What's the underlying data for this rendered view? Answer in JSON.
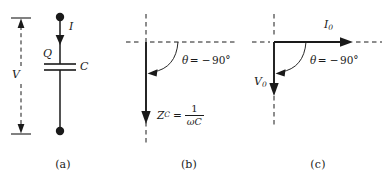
{
  "figure": {
    "background_color": "#ffffff",
    "ink_color": "#1a1a1a"
  },
  "panels": [
    {
      "id": "a",
      "caption": "(a)",
      "description": "Capacitor circuit branch with current, charge, capacitance and voltage labels",
      "labels": {
        "current": "I",
        "charge": "Q",
        "capacitance": "C",
        "voltage": "V"
      },
      "elements": {
        "top_node": "terminal-dot",
        "bottom_node": "terminal-dot",
        "component": "capacitor",
        "voltage_arrow": "double-headed-dashed-arrow"
      }
    },
    {
      "id": "b",
      "caption": "(b)",
      "description": "Impedance phasor diagram for a capacitor pointing along the negative imaginary axis",
      "angle": {
        "symbol": "θ",
        "equals": "=",
        "minus": "−",
        "value": "90",
        "degree": "°",
        "full": "θ = −90°"
      },
      "impedance": {
        "symbol": "Z",
        "subscript": "C",
        "equals": "=",
        "numerator": "1",
        "denominator": "ωC",
        "full": "Z_C = 1/ωC"
      }
    },
    {
      "id": "c",
      "caption": "(c)",
      "description": "Phasor diagram showing current leading voltage by 90 degrees",
      "angle": {
        "symbol": "θ",
        "equals": "=",
        "minus": "−",
        "value": "90",
        "degree": "°",
        "full": "θ = −90°"
      },
      "phasors": {
        "current_symbol": "I",
        "current_subscript": "0",
        "voltage_symbol": "V",
        "voltage_subscript": "0"
      }
    }
  ]
}
